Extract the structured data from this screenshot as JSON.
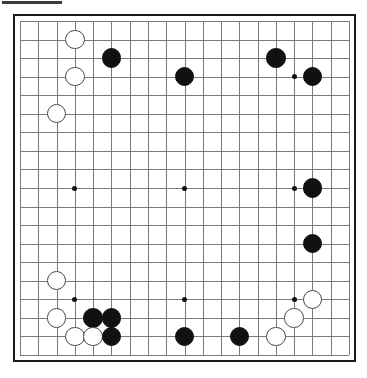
{
  "document": {
    "kind": "go-board-diagram",
    "header_rule_visible": true
  },
  "board": {
    "size": 19,
    "columns": 19,
    "rows": 19,
    "line_color": "#7a7a7a",
    "border_color": "#1a1a1a",
    "background_color": "#ffffff",
    "black_stone_color": "#111111",
    "white_stone_color": "#ffffff",
    "white_stone_outline": "#4a4a4a",
    "star_point_color": "#111111",
    "star_points": [
      {
        "col": 4,
        "row": 4
      },
      {
        "col": 10,
        "row": 4
      },
      {
        "col": 16,
        "row": 4
      },
      {
        "col": 4,
        "row": 10
      },
      {
        "col": 10,
        "row": 10
      },
      {
        "col": 16,
        "row": 10
      },
      {
        "col": 4,
        "row": 16
      },
      {
        "col": 10,
        "row": 16
      },
      {
        "col": 16,
        "row": 16
      }
    ],
    "stones": [
      {
        "col": 4,
        "row": 2,
        "color": "white"
      },
      {
        "col": 6,
        "row": 3,
        "color": "black"
      },
      {
        "col": 4,
        "row": 4,
        "color": "white"
      },
      {
        "col": 3,
        "row": 6,
        "color": "white"
      },
      {
        "col": 10,
        "row": 4,
        "color": "black"
      },
      {
        "col": 15,
        "row": 3,
        "color": "black"
      },
      {
        "col": 17,
        "row": 4,
        "color": "black"
      },
      {
        "col": 17,
        "row": 10,
        "color": "black"
      },
      {
        "col": 17,
        "row": 13,
        "color": "black"
      },
      {
        "col": 3,
        "row": 15,
        "color": "white"
      },
      {
        "col": 3,
        "row": 17,
        "color": "white"
      },
      {
        "col": 5,
        "row": 17,
        "color": "black"
      },
      {
        "col": 6,
        "row": 17,
        "color": "black"
      },
      {
        "col": 4,
        "row": 18,
        "color": "white"
      },
      {
        "col": 5,
        "row": 18,
        "color": "white"
      },
      {
        "col": 6,
        "row": 18,
        "color": "black"
      },
      {
        "col": 10,
        "row": 18,
        "color": "black"
      },
      {
        "col": 13,
        "row": 18,
        "color": "black"
      },
      {
        "col": 15,
        "row": 18,
        "color": "white"
      },
      {
        "col": 16,
        "row": 17,
        "color": "white"
      },
      {
        "col": 17,
        "row": 16,
        "color": "white"
      }
    ]
  }
}
